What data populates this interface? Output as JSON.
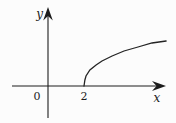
{
  "labels": {
    "y_axis": "y",
    "x_axis": "x",
    "origin": "0",
    "tick_2": "2"
  },
  "colors": {
    "line": "#1c1c1c",
    "background": "#fcfcfc"
  },
  "chart_data": {
    "type": "line",
    "title": "",
    "xlabel": "x",
    "ylabel": "y",
    "grid": false,
    "legend": false,
    "xlim": [
      -2,
      6.6
    ],
    "ylim": [
      -1.6,
      3.95
    ],
    "x_ticks": [
      2
    ],
    "origin_label": "0",
    "series": [
      {
        "name": "sqrt-branch-curve",
        "note": "square-root-shaped curve starting on the x-axis at x = 2 and rising to the right",
        "points": [
          [
            2.0,
            0.0
          ],
          [
            2.05,
            0.3
          ],
          [
            2.11,
            0.5
          ],
          [
            2.33,
            0.8
          ],
          [
            2.67,
            1.05
          ],
          [
            3.0,
            1.25
          ],
          [
            3.56,
            1.5
          ],
          [
            4.22,
            1.75
          ],
          [
            5.0,
            1.95
          ],
          [
            5.78,
            2.15
          ],
          [
            6.56,
            2.25
          ]
        ]
      }
    ]
  }
}
